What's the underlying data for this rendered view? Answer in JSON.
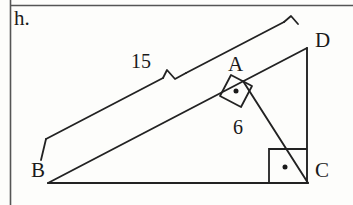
{
  "figure": {
    "item_label": "h.",
    "type": "geometry-diagram",
    "background_color": "#fdfdfb",
    "stroke_color": "#222222",
    "rule_color": "#555555"
  },
  "vertices": {
    "B": {
      "label": "B",
      "x": 48,
      "y": 183
    },
    "C": {
      "label": "C",
      "x": 308,
      "y": 183
    },
    "D": {
      "label": "D",
      "x": 307,
      "y": 48
    },
    "A": {
      "label": "A",
      "x": 243,
      "y": 81
    }
  },
  "measurements": {
    "hypotenuse": {
      "label": "15",
      "value": 15,
      "segment": "BD"
    },
    "altitude": {
      "label": "6",
      "value": 6,
      "segment": "AC"
    }
  },
  "angle_markers": [
    {
      "name": "right-angle-at-A",
      "vertex": "A",
      "style": "square-with-dot"
    },
    {
      "name": "right-angle-at-C",
      "vertex": "C",
      "style": "square-with-dot"
    }
  ],
  "segments": [
    {
      "name": "BC",
      "from": "B",
      "to": "C"
    },
    {
      "name": "CD",
      "from": "C",
      "to": "D"
    },
    {
      "name": "BD",
      "from": "B",
      "to": "D"
    },
    {
      "name": "AC",
      "from": "A",
      "to": "C"
    }
  ],
  "page_rules": {
    "vertical_margin_line": true,
    "horizontal_top_line": true
  }
}
